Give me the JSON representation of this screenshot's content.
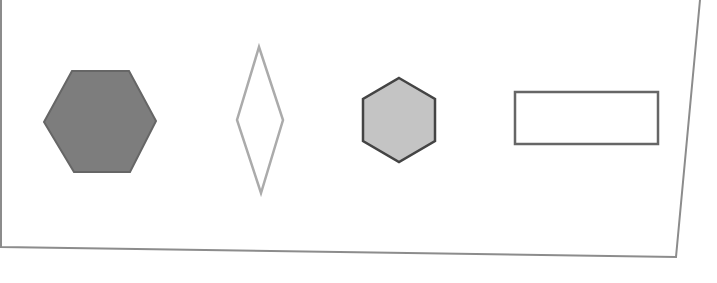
{
  "figure": {
    "background": "#ffffff",
    "frame": {
      "stroke": "#8c8c8c",
      "points": "1,0 1,247 676,257 700,0"
    },
    "shapes": [
      {
        "id": "large-hexagon",
        "type": "hexagon",
        "orientation": "flat-top",
        "points": "72,71 129,71 156,121 130,172 74,172 44,122",
        "fill": "#7d7d7d",
        "stroke": "#666666",
        "stroke_width": 2
      },
      {
        "id": "diamond",
        "type": "rhombus",
        "points": "259,47 283,120 261,193 237,120",
        "fill": "none",
        "stroke": "#ababab",
        "stroke_width": 2.5
      },
      {
        "id": "small-hexagon",
        "type": "hexagon",
        "orientation": "pointy-top",
        "points": "399,78 435,99 435,141 399,162 363,141 363,99",
        "fill": "#c4c4c4",
        "stroke": "#444444",
        "stroke_width": 2.5
      },
      {
        "id": "rectangle",
        "type": "rectangle",
        "x": 515,
        "y": 92,
        "width": 143,
        "height": 52,
        "fill": "none",
        "stroke": "#666666",
        "stroke_width": 2.5
      }
    ]
  }
}
